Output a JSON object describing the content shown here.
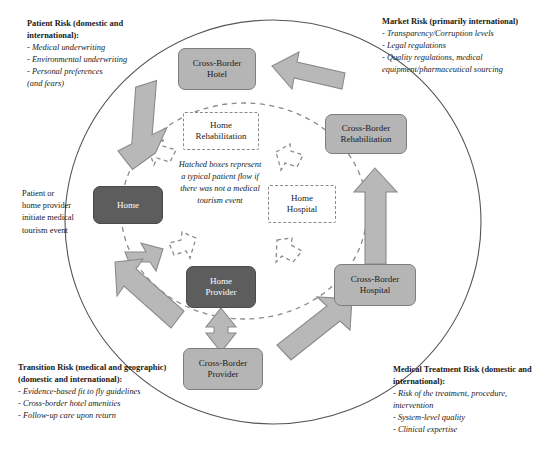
{
  "diagram": {
    "colors": {
      "node_dark_fill": "#5d5d5d",
      "node_light_fill": "#b5b5b5",
      "arrow_fill": "#b8b8b8",
      "arrow_stroke": "#8a8a8a",
      "outline": "#555555",
      "dashed": "#8a8a8a",
      "text": "#1a1a1a"
    }
  },
  "corners": {
    "patient_risk": {
      "title": "Patient Risk (domestic and international):",
      "items": [
        "- Medical underwriting",
        "- Environmental underwriting",
        "- Personal preferences",
        "(and fears)"
      ]
    },
    "market_risk": {
      "title": "Market Risk (primarily international)",
      "items": [
        "- Transparency/Corruption levels",
        "- Legal regulations",
        "- Quality regulations, medical",
        "equipment/pharmaceutical sourcing"
      ]
    },
    "transition_risk": {
      "title": "Transition Risk (medical and geographic) (domestic and international):",
      "items": [
        "- Evidence-based fit to fly guidelines",
        "- Cross-border hotel amenities",
        "- Follow-up care upon return"
      ]
    },
    "medical_treatment_risk": {
      "title": "Medical Treatment Risk (domestic and international):",
      "items": [
        "- Risk of the treatment, procedure,",
        "intervention",
        "- System-level quality",
        "- Clinical expertise"
      ]
    }
  },
  "side_label": {
    "text": "Patient or home provider initiate medical tourism event"
  },
  "legend": {
    "note": "Hatched boxes represent a typical patient flow if there was not a medical tourism event"
  },
  "nodes": {
    "cross_border_hotel": {
      "label": "Cross-Border Hotel",
      "line1": "Cross-Border",
      "line2": "Hotel",
      "style": "solid-light"
    },
    "cross_border_rehabilitation": {
      "label": "Cross-Border Rehabilitation",
      "line1": "Cross-Border",
      "line2": "Rehabilitation",
      "style": "solid-light"
    },
    "cross_border_hospital": {
      "label": "Cross-Border Hospital",
      "line1": "Cross-Border",
      "line2": "Hospital",
      "style": "solid-light"
    },
    "cross_border_provider": {
      "label": "Cross-Border Provider",
      "line1": "Cross-Border",
      "line2": "Provider",
      "style": "solid-light"
    },
    "home": {
      "label": "Home",
      "line1": "Home",
      "line2": "",
      "style": "solid-dark"
    },
    "home_provider": {
      "label": "Home Provider",
      "line1": "Home",
      "line2": "Provider",
      "style": "solid-dark"
    },
    "home_rehabilitation": {
      "label": "Home Rehabilitation",
      "line1": "Home",
      "line2": "Rehabilitation",
      "style": "hatched"
    },
    "home_hospital": {
      "label": "Home Hospital",
      "line1": "Home",
      "line2": "Hospital",
      "style": "hatched"
    }
  }
}
